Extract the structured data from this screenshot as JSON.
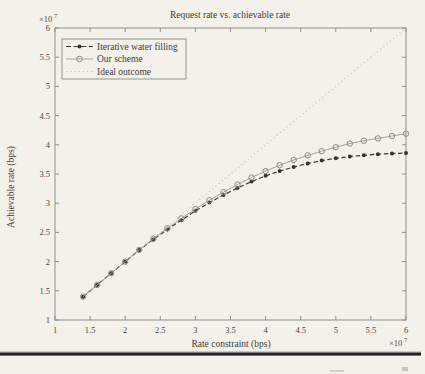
{
  "figure": {
    "title": "Request rate vs. achievable rate",
    "xlabel": "Rate constraint (bps)",
    "ylabel": "Achievable rate (bps)",
    "x_multiplier_base": "×10",
    "x_multiplier_exp": "7",
    "y_multiplier_base": "×10",
    "y_multiplier_exp": "7"
  },
  "legend": {
    "items": [
      {
        "label": "Iterative water filling",
        "line_style": "dash-dot-black",
        "marker": "filled-circle"
      },
      {
        "label": "Our scheme",
        "line_style": "solid-gray",
        "marker": "open-circle"
      },
      {
        "label": "Ideal outcome",
        "line_style": "dotted-light",
        "marker": "none"
      }
    ]
  },
  "colors": {
    "paper": "#f3f1ea",
    "frame": "#90908a",
    "iterative_line": "#3b3a35",
    "iterative_marker": "#34332e",
    "our_line": "#a3a69b",
    "our_marker_stroke": "#8a8d81",
    "ideal_line": "#c9ccbe",
    "bottom_rule": "#232323"
  },
  "chart_data": {
    "type": "line",
    "title": "Request rate vs. achievable rate",
    "xlabel": "Rate constraint (bps)",
    "ylabel": "Achievable rate (bps)",
    "axis_multiplier": "×10^7",
    "xlim": [
      1,
      6
    ],
    "ylim": [
      1,
      6
    ],
    "grid": false,
    "legend_position": "top-left",
    "x_ticks": [
      1,
      1.5,
      2,
      2.5,
      3,
      3.5,
      4,
      4.5,
      5,
      5.5,
      6
    ],
    "x_tick_labels": [
      "1",
      "1.5",
      "2",
      "2.5",
      "3",
      "3.5",
      "4",
      "4.5",
      "5",
      "5.5",
      "6"
    ],
    "y_ticks": [
      1,
      1.5,
      2,
      2.5,
      3,
      3.5,
      4,
      4.5,
      5,
      5.5,
      6
    ],
    "y_tick_labels": [
      "1",
      "1.5",
      "2",
      "2.5",
      "3",
      "3.5",
      "4",
      "4.5",
      "5",
      "5.5",
      "6"
    ],
    "x": [
      1.4,
      1.6,
      1.8,
      2.0,
      2.2,
      2.4,
      2.6,
      2.8,
      3.0,
      3.2,
      3.4,
      3.6,
      3.8,
      4.0,
      4.2,
      4.4,
      4.6,
      4.8,
      5.0,
      5.2,
      5.4,
      5.6,
      5.8,
      6.0
    ],
    "series": [
      {
        "name": "Iterative water filling",
        "values": [
          1.4,
          1.6,
          1.8,
          2.0,
          2.2,
          2.38,
          2.55,
          2.71,
          2.87,
          3.01,
          3.14,
          3.26,
          3.37,
          3.47,
          3.55,
          3.62,
          3.68,
          3.73,
          3.77,
          3.8,
          3.82,
          3.84,
          3.85,
          3.86
        ]
      },
      {
        "name": "Our scheme",
        "values": [
          1.4,
          1.6,
          1.8,
          2.0,
          2.2,
          2.39,
          2.57,
          2.74,
          2.9,
          3.05,
          3.19,
          3.32,
          3.44,
          3.55,
          3.65,
          3.74,
          3.82,
          3.89,
          3.96,
          4.02,
          4.07,
          4.11,
          4.15,
          4.19
        ]
      },
      {
        "name": "Ideal outcome",
        "values": [
          1.4,
          1.6,
          1.8,
          2.0,
          2.2,
          2.4,
          2.6,
          2.8,
          3.0,
          3.2,
          3.4,
          3.6,
          3.8,
          4.0,
          4.2,
          4.4,
          4.6,
          4.8,
          5.0,
          5.2,
          5.4,
          5.6,
          5.8,
          6.0
        ]
      }
    ]
  }
}
